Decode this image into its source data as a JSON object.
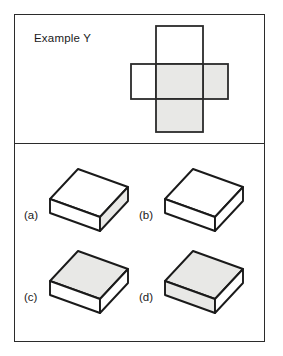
{
  "figure": {
    "title": "Example Y",
    "colors": {
      "stroke": "#2b2b2b",
      "shaded_face": "#e8e8e6",
      "plain_face": "#ffffff",
      "page_background": "#ffffff",
      "text": "#1a1a1a"
    }
  },
  "top_panel": {
    "name": "example-panel",
    "label": "Example Y",
    "net": {
      "name": "unfolded-box-net",
      "type": "cross-net",
      "faces": [
        {
          "id": "top-flap",
          "position": "top",
          "shading": "plain",
          "label": ""
        },
        {
          "id": "left-flap",
          "position": "middle-left",
          "shading": "plain",
          "label": ""
        },
        {
          "id": "center-face",
          "position": "middle-center",
          "shading": "shaded",
          "label": ""
        },
        {
          "id": "right-flap",
          "position": "middle-right",
          "shading": "shaded",
          "label": ""
        },
        {
          "id": "bottom-flap",
          "position": "bottom",
          "shading": "shaded",
          "label": ""
        }
      ]
    }
  },
  "bottom_panel": {
    "name": "answer-options-panel",
    "options": [
      {
        "key": "a",
        "label": "(a)",
        "box": {
          "name": "isometric-box-a",
          "top_face": "plain",
          "left_face": "plain",
          "right_face": "shaded"
        }
      },
      {
        "key": "b",
        "label": "(b)",
        "box": {
          "name": "isometric-box-b",
          "top_face": "plain",
          "left_face": "plain",
          "right_face": "plain"
        }
      },
      {
        "key": "c",
        "label": "(c)",
        "box": {
          "name": "isometric-box-c",
          "top_face": "shaded",
          "left_face": "plain",
          "right_face": "plain"
        }
      },
      {
        "key": "d",
        "label": "(d)",
        "box": {
          "name": "isometric-box-d",
          "top_face": "shaded",
          "left_face": "shaded",
          "right_face": "plain"
        }
      }
    ]
  }
}
